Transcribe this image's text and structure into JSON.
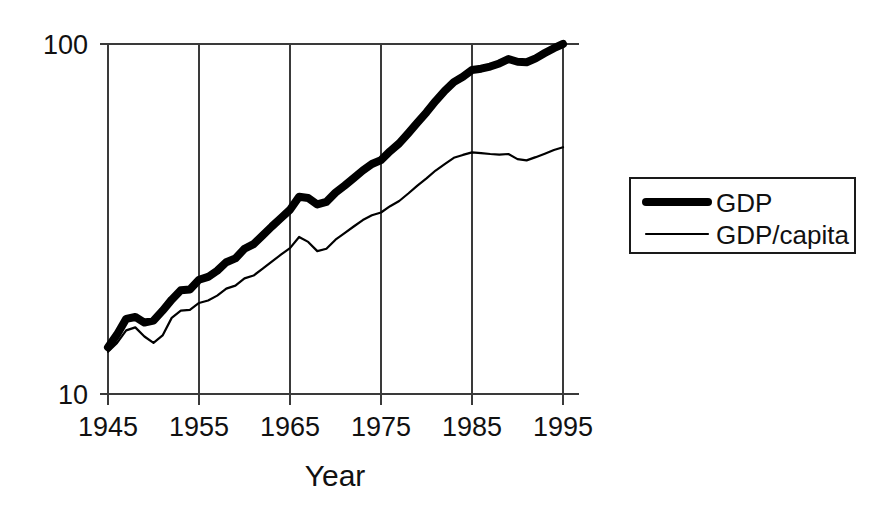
{
  "chart_data": {
    "type": "line",
    "title": "",
    "xlabel": "Year",
    "ylabel": "",
    "yscale": "log",
    "ylim": [
      10,
      100
    ],
    "xlim": [
      1945,
      1995
    ],
    "grid": "vertical",
    "legend_position": "right-outside",
    "y_tick_labels": [
      "100",
      "10"
    ],
    "y_ticks": [
      100,
      10
    ],
    "x_tick_labels": [
      "1945",
      "1955",
      "1965",
      "1975",
      "1985",
      "1995"
    ],
    "x_ticks": [
      1945,
      1955,
      1965,
      1975,
      1985,
      1995
    ],
    "x": [
      1945,
      1946,
      1947,
      1948,
      1949,
      1950,
      1951,
      1952,
      1953,
      1954,
      1955,
      1956,
      1957,
      1958,
      1959,
      1960,
      1961,
      1962,
      1963,
      1964,
      1965,
      1966,
      1967,
      1968,
      1969,
      1970,
      1971,
      1972,
      1973,
      1974,
      1975,
      1976,
      1977,
      1978,
      1979,
      1980,
      1981,
      1982,
      1983,
      1984,
      1985,
      1986,
      1987,
      1988,
      1989,
      1990,
      1991,
      1992,
      1993,
      1994,
      1995
    ],
    "series": [
      {
        "name": "GDP",
        "line_style": "thick",
        "color": "#000000",
        "values": [
          13.6,
          14.8,
          16.4,
          16.6,
          16.0,
          16.2,
          17.3,
          18.6,
          19.8,
          19.9,
          21.2,
          21.6,
          22.5,
          23.8,
          24.4,
          26.0,
          26.8,
          28.4,
          30.1,
          31.8,
          33.6,
          36.6,
          36.3,
          34.8,
          35.4,
          37.6,
          39.4,
          41.4,
          43.5,
          45.4,
          46.6,
          49.4,
          52.0,
          55.6,
          59.6,
          63.8,
          68.7,
          73.5,
          77.8,
          80.6,
          84.3,
          85.0,
          86.2,
          88.0,
          90.6,
          89.0,
          88.7,
          91.0,
          94.2,
          97.3,
          100.0
        ]
      },
      {
        "name": "GDP/capita",
        "line_style": "thin",
        "color": "#000000",
        "values": [
          13.2,
          14.0,
          15.2,
          15.5,
          14.6,
          14.0,
          14.7,
          16.5,
          17.3,
          17.4,
          18.2,
          18.5,
          19.1,
          20.0,
          20.4,
          21.4,
          21.8,
          22.8,
          23.9,
          25.0,
          26.1,
          28.1,
          27.2,
          25.6,
          26.0,
          27.6,
          28.8,
          30.1,
          31.4,
          32.4,
          33.0,
          34.4,
          35.6,
          37.4,
          39.4,
          41.3,
          43.5,
          45.4,
          47.3,
          48.2,
          49.0,
          48.8,
          48.5,
          48.3,
          48.5,
          46.9,
          46.5,
          47.5,
          48.6,
          49.8,
          50.7
        ]
      }
    ]
  },
  "legend": {
    "entries": [
      {
        "label": "GDP",
        "style": "thick"
      },
      {
        "label": "GDP/capita",
        "style": "thin"
      }
    ]
  },
  "axis": {
    "x_title": "Year"
  }
}
